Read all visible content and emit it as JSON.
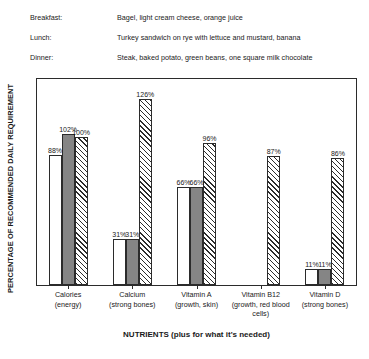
{
  "meals": {
    "rows": [
      {
        "label": "Breakfast:",
        "value": "Bagel, light cream cheese, orange juice"
      },
      {
        "label": "Lunch:",
        "value": "Turkey sandwich on rye with lettuce and mustard, banana"
      },
      {
        "label": "Dinner:",
        "value": "Steak, baked potato, green beans, one square milk chocolate"
      }
    ]
  },
  "chart_data": {
    "type": "bar",
    "title": "",
    "xlabel": "NUTRIENTS (plus for what it's needed)",
    "ylabel": "PERCENTAGE OF RECOMMENDED DAILY REQUIREMENT",
    "ylim": [
      0,
      140
    ],
    "grid": false,
    "legend": "none",
    "categories": [
      "Calories\n(energy)",
      "Calcium\n(strong bones)",
      "Vitamin A\n(growth, skin)",
      "Vitamin B12\n(growth, red blood cells)",
      "Vitamin D\n(strong bones)"
    ],
    "category_lines": [
      [
        "Calories",
        "(energy)"
      ],
      [
        "Calcium",
        "(strong bones)"
      ],
      [
        "Vitamin A",
        "(growth, skin)"
      ],
      [
        "Vitamin B12",
        "(growth, red blood",
        "cells)"
      ],
      [
        "Vitamin D",
        "(strong bones)"
      ]
    ],
    "series": [
      {
        "name": "white",
        "fill": "white",
        "values": [
          88,
          31,
          66,
          0,
          11
        ],
        "labels": [
          "88%",
          "31%",
          "66%",
          "",
          "11%"
        ]
      },
      {
        "name": "gray",
        "fill": "gray",
        "values": [
          102,
          31,
          66,
          0,
          11
        ],
        "labels": [
          "102%",
          "31%",
          "66%",
          "",
          "11%"
        ]
      },
      {
        "name": "hatched",
        "fill": "hatch",
        "values": [
          100,
          126,
          96,
          87,
          86
        ],
        "labels": [
          "100%",
          "126%",
          "96%",
          "87%",
          "86%"
        ]
      }
    ]
  }
}
